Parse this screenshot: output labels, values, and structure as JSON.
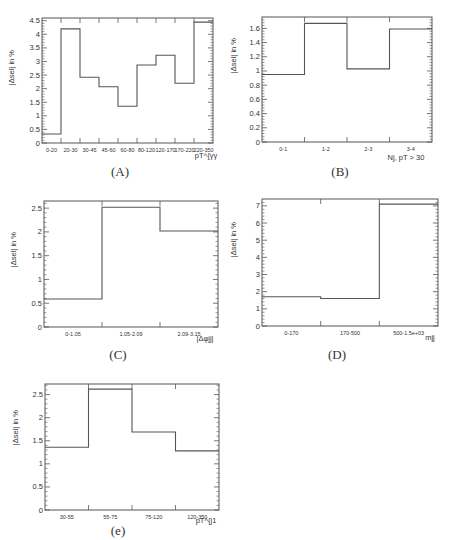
{
  "chart_data": [
    {
      "id": "A",
      "type": "bar",
      "style": "step-histogram",
      "caption": "(A)",
      "title": "",
      "xlabel": "p_T^{γγ}",
      "ylabel": "|Δ_sel| in %",
      "categories": [
        "0-20",
        "20-30",
        "30-45",
        "45-60",
        "60-80",
        "80-120",
        "120-170",
        "170-220",
        "220-350"
      ],
      "values": [
        0.33,
        4.2,
        2.42,
        2.07,
        1.35,
        2.87,
        3.23,
        2.2,
        4.45
      ],
      "ylim": [
        0,
        4.6
      ],
      "yticks": [
        0,
        0.5,
        1,
        1.5,
        2,
        2.5,
        3,
        3.5,
        4,
        4.5
      ],
      "ytick_labels": [
        "0",
        "0.5",
        "1",
        "1.5",
        "2",
        "2.5",
        "3",
        "3.5",
        "4",
        "4.5"
      ],
      "grid": false,
      "legend": null
    },
    {
      "id": "B",
      "type": "bar",
      "style": "step-histogram",
      "caption": "(B)",
      "title": "",
      "xlabel": "N_{j, pT > 30}",
      "ylabel": "|Δ_sel| in %",
      "categories": [
        "0-1",
        "1-2",
        "2-3",
        "3-4"
      ],
      "values": [
        0.95,
        1.67,
        1.03,
        1.59
      ],
      "ylim": [
        0,
        1.76
      ],
      "yticks": [
        0,
        0.2,
        0.4,
        0.6,
        0.8,
        1,
        1.2,
        1.4,
        1.6
      ],
      "ytick_labels": [
        "0",
        "0.2",
        "0.4",
        "0.6",
        "0.8",
        "1",
        "1.2",
        "1.4",
        "1.6"
      ],
      "grid": false,
      "legend": null
    },
    {
      "id": "C",
      "type": "bar",
      "style": "step-histogram",
      "caption": "(C)",
      "title": "",
      "xlabel": "|Δφ_jj|",
      "ylabel": "|Δ_sel| in %",
      "categories": [
        "0-1.05",
        "1.05-2.09",
        "2.09-3.15"
      ],
      "values": [
        0.59,
        2.52,
        2.02
      ],
      "ylim": [
        0,
        2.65
      ],
      "yticks": [
        0,
        0.5,
        1,
        1.5,
        2,
        2.5
      ],
      "ytick_labels": [
        "0",
        "0.5",
        "1",
        "1.5",
        "2",
        "2.5"
      ],
      "grid": false,
      "legend": null
    },
    {
      "id": "D",
      "type": "bar",
      "style": "step-histogram",
      "caption": "(D)",
      "title": "",
      "xlabel": "m_jj",
      "ylabel": "|Δ_sel| in %",
      "categories": [
        "0-170",
        "170-500",
        "500-1.5e+03"
      ],
      "values": [
        1.7,
        1.6,
        7.1
      ],
      "ylim": [
        0,
        7.4
      ],
      "yticks": [
        0,
        1,
        2,
        3,
        4,
        5,
        6,
        7
      ],
      "ytick_labels": [
        "0",
        "1",
        "2",
        "3",
        "4",
        "5",
        "6",
        "7"
      ],
      "grid": false,
      "legend": null
    },
    {
      "id": "E",
      "type": "bar",
      "style": "step-histogram",
      "caption": "(e)",
      "title": "",
      "xlabel": "p_T^{j1}",
      "ylabel": "|Δ_sel| in %",
      "categories": [
        "30-55",
        "55-75",
        "75-120",
        "120-350"
      ],
      "values": [
        1.36,
        2.62,
        1.69,
        1.28
      ],
      "ylim": [
        0,
        2.73
      ],
      "yticks": [
        0,
        0.5,
        1,
        1.5,
        2,
        2.5
      ],
      "ytick_labels": [
        "0",
        "0.5",
        "1",
        "1.5",
        "2",
        "2.5"
      ],
      "grid": false,
      "legend": null
    }
  ],
  "layout": {
    "panels": [
      {
        "id": "A",
        "frame": {
          "x": 42,
          "y": 18,
          "w": 171,
          "h": 125
        },
        "ylabel_pos": {
          "x": 14,
          "y": 50
        },
        "xlabel_pos": {
          "x": 206,
          "y": 158
        },
        "caption_pos": {
          "x": 100,
          "y": 166
        }
      },
      {
        "id": "B",
        "frame": {
          "x": 262,
          "y": 17,
          "w": 170,
          "h": 125
        },
        "ylabel_pos": {
          "x": 236,
          "y": 38
        },
        "xlabel_pos": {
          "x": 406,
          "y": 160
        },
        "caption_pos": {
          "x": 320,
          "y": 166
        }
      },
      {
        "id": "C",
        "frame": {
          "x": 44,
          "y": 201,
          "w": 174,
          "h": 126
        },
        "ylabel_pos": {
          "x": 16,
          "y": 232
        },
        "xlabel_pos": {
          "x": 205,
          "y": 341
        },
        "caption_pos": {
          "x": 98,
          "y": 349
        }
      },
      {
        "id": "D",
        "frame": {
          "x": 262,
          "y": 199,
          "w": 176,
          "h": 127
        },
        "ylabel_pos": {
          "x": 236,
          "y": 222
        },
        "xlabel_pos": {
          "x": 430,
          "y": 340
        },
        "caption_pos": {
          "x": 317,
          "y": 349
        }
      },
      {
        "id": "E",
        "frame": {
          "x": 45,
          "y": 384,
          "w": 174,
          "h": 126
        },
        "ylabel_pos": {
          "x": 18,
          "y": 410
        },
        "xlabel_pos": {
          "x": 206,
          "y": 523
        },
        "caption_pos": {
          "x": 98,
          "y": 525
        }
      }
    ]
  },
  "colors": {
    "line": "#555555",
    "text": "#333333",
    "background": "#ffffff"
  }
}
